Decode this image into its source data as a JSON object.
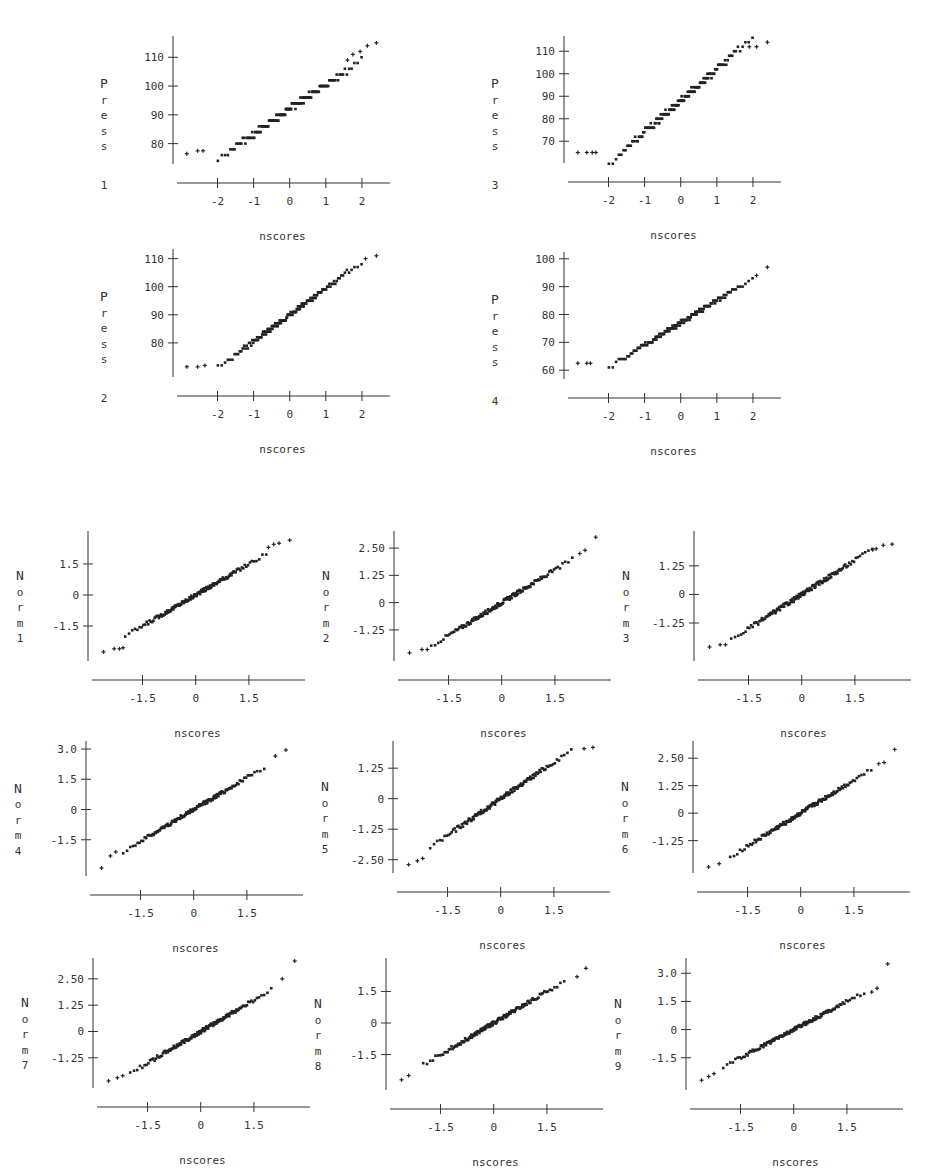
{
  "chart_data": [
    {
      "id": "press1",
      "type": "scatter",
      "title": "",
      "xlabel": "nscores",
      "ylabel": "Press 1",
      "ylabel_chars": [
        "P",
        "r",
        "e",
        "s",
        "s",
        "",
        "1"
      ],
      "xlim": [
        -2.9,
        2.5
      ],
      "ylim": [
        75,
        116
      ],
      "xticks": [
        -2,
        -1,
        0,
        1,
        2
      ],
      "xtick_labels": [
        "-2",
        "-1",
        "0",
        "1",
        "2"
      ],
      "yticks": [
        80,
        90,
        100,
        110
      ],
      "ytick_labels": [
        "80",
        "90",
        "100",
        "110"
      ],
      "n_points": 150,
      "mean": 92,
      "sd": 8.6,
      "step": 2,
      "outliers": [
        [
          -2.85,
          76.5
        ],
        [
          -2.55,
          77.5
        ],
        [
          -2.4,
          77.5
        ],
        [
          1.95,
          112
        ],
        [
          2.4,
          115
        ],
        [
          2.15,
          114
        ],
        [
          1.75,
          111
        ],
        [
          1.6,
          109
        ]
      ],
      "grid": false
    },
    {
      "id": "press3",
      "type": "scatter",
      "title": "",
      "xlabel": "nscores",
      "ylabel": "Press 3",
      "ylabel_chars": [
        "P",
        "r",
        "e",
        "s",
        "s",
        "",
        "3"
      ],
      "xlim": [
        -2.9,
        2.5
      ],
      "ylim": [
        63,
        115
      ],
      "xticks": [
        -2,
        -1,
        0,
        1,
        2
      ],
      "xtick_labels": [
        "-2",
        "-1",
        "0",
        "1",
        "2"
      ],
      "yticks": [
        70,
        80,
        90,
        100,
        110
      ],
      "ytick_labels": [
        "70",
        "80",
        "90",
        "100",
        "110"
      ],
      "n_points": 150,
      "mean": 88,
      "sd": 14,
      "step": 2,
      "outliers": [
        [
          -2.85,
          65
        ],
        [
          -2.6,
          65
        ],
        [
          -2.45,
          65
        ],
        [
          -2.35,
          65
        ],
        [
          1.9,
          112
        ],
        [
          2.1,
          112
        ],
        [
          2.4,
          114
        ]
      ],
      "grid": false
    },
    {
      "id": "press2",
      "type": "scatter",
      "title": "",
      "xlabel": "nscores",
      "ylabel": "Press 2",
      "ylabel_chars": [
        "P",
        "r",
        "e",
        "s",
        "s",
        "",
        "2"
      ],
      "xlim": [
        -2.9,
        2.5
      ],
      "ylim": [
        70,
        112
      ],
      "xticks": [
        -2,
        -1,
        0,
        1,
        2
      ],
      "xtick_labels": [
        "-2",
        "-1",
        "0",
        "1",
        "2"
      ],
      "yticks": [
        80,
        90,
        100,
        110
      ],
      "ytick_labels": [
        "80",
        "90",
        "100",
        "110"
      ],
      "n_points": 150,
      "mean": 90,
      "sd": 9.5,
      "step": 1,
      "outliers": [
        [
          -2.85,
          71.5
        ],
        [
          -2.55,
          71.5
        ],
        [
          -2.35,
          72
        ],
        [
          2.1,
          110
        ],
        [
          2.4,
          111
        ]
      ],
      "grid": false
    },
    {
      "id": "press4",
      "type": "scatter",
      "title": "",
      "xlabel": "nscores",
      "ylabel": "Press 4",
      "ylabel_chars": [
        "P",
        "r",
        "e",
        "s",
        "s",
        "",
        "4"
      ],
      "xlim": [
        -2.9,
        2.5
      ],
      "ylim": [
        59,
        101
      ],
      "xticks": [
        -2,
        -1,
        0,
        1,
        2
      ],
      "xtick_labels": [
        "-2",
        "-1",
        "0",
        "1",
        "2"
      ],
      "yticks": [
        60,
        70,
        80,
        90,
        100
      ],
      "ytick_labels": [
        "60",
        "70",
        "80",
        "90",
        "100"
      ],
      "n_points": 150,
      "mean": 77,
      "sd": 8.0,
      "step": 1,
      "outliers": [
        [
          -2.85,
          62.5
        ],
        [
          -2.6,
          62.5
        ],
        [
          -2.5,
          62.5
        ],
        [
          2.1,
          94
        ],
        [
          2.4,
          97
        ]
      ],
      "grid": false
    },
    {
      "id": "norm1",
      "type": "scatter",
      "xlabel": "nscores",
      "ylabel": "Norm 1",
      "ylabel_chars": [
        "N",
        "o",
        "r",
        "m",
        "1"
      ],
      "xlim": [
        -2.7,
        2.8
      ],
      "ylim": [
        -2.9,
        2.9
      ],
      "xticks": [
        -1.5,
        0,
        1.5
      ],
      "xtick_labels": [
        "-1.5",
        "0",
        "1.5"
      ],
      "yticks": [
        -1.5,
        0,
        1.5
      ],
      "ytick_labels": [
        "-1.5",
        "0",
        "1.5"
      ],
      "n_points": 150,
      "slope": 1.0,
      "outliers": [
        [
          -2.6,
          -2.75
        ],
        [
          -2.3,
          -2.6
        ],
        [
          -2.15,
          -2.6
        ],
        [
          -2.05,
          -2.55
        ],
        [
          2.05,
          2.3
        ],
        [
          2.2,
          2.45
        ],
        [
          2.35,
          2.5
        ],
        [
          2.65,
          2.65
        ]
      ]
    },
    {
      "id": "norm2",
      "type": "scatter",
      "xlabel": "nscores",
      "ylabel": "Norm 2",
      "ylabel_chars": [
        "N",
        "o",
        "r",
        "m",
        "2"
      ],
      "xlim": [
        -2.7,
        2.8
      ],
      "ylim": [
        -2.4,
        3.1
      ],
      "xticks": [
        -1.5,
        0,
        1.5
      ],
      "xtick_labels": [
        "-1.5",
        "0",
        "1.5"
      ],
      "yticks": [
        -1.25,
        0,
        1.25,
        2.5
      ],
      "ytick_labels": [
        "-1.25",
        "0",
        "1.25",
        "2.50"
      ],
      "n_points": 150,
      "slope": 1.0,
      "outliers": [
        [
          -2.6,
          -2.3
        ],
        [
          -2.25,
          -2.15
        ],
        [
          -2.1,
          -2.15
        ],
        [
          2.2,
          2.25
        ],
        [
          2.35,
          2.4
        ],
        [
          2.65,
          3.0
        ]
      ]
    },
    {
      "id": "norm3",
      "type": "scatter",
      "xlabel": "nscores",
      "ylabel": "Norm 3",
      "ylabel_chars": [
        "N",
        "o",
        "r",
        "m",
        "3"
      ],
      "xlim": [
        -2.7,
        2.8
      ],
      "ylim": [
        -2.65,
        2.6
      ],
      "xticks": [
        -1.5,
        0,
        1.5
      ],
      "xtick_labels": [
        "-1.5",
        "0",
        "1.5"
      ],
      "yticks": [
        -1.25,
        0,
        1.25
      ],
      "ytick_labels": [
        "-1.25",
        "0",
        "1.25"
      ],
      "n_points": 150,
      "slope": 1.0,
      "outliers": [
        [
          -2.6,
          -2.3
        ],
        [
          -2.3,
          -2.2
        ],
        [
          -2.15,
          -2.2
        ],
        [
          2.0,
          1.95
        ],
        [
          2.1,
          2.0
        ],
        [
          2.3,
          2.15
        ],
        [
          2.55,
          2.2
        ]
      ]
    },
    {
      "id": "norm4",
      "type": "scatter",
      "xlabel": "nscores",
      "ylabel": "Norm 4",
      "ylabel_chars": [
        "N",
        "o",
        "r",
        "m",
        "4"
      ],
      "xlim": [
        -2.7,
        2.8
      ],
      "ylim": [
        -3.0,
        3.2
      ],
      "xticks": [
        -1.5,
        0,
        1.5
      ],
      "xtick_labels": [
        "-1.5",
        "0",
        "1.5"
      ],
      "yticks": [
        -1.5,
        0,
        1.5,
        3.0
      ],
      "ytick_labels": [
        "-1.5",
        "0",
        "1.5",
        "3.0"
      ],
      "n_points": 150,
      "slope": 1.05,
      "outliers": [
        [
          -2.6,
          -2.9
        ],
        [
          -2.35,
          -2.3
        ],
        [
          -2.2,
          -2.1
        ],
        [
          2.3,
          2.65
        ],
        [
          2.6,
          2.95
        ]
      ]
    },
    {
      "id": "norm5",
      "type": "scatter",
      "xlabel": "nscores",
      "ylabel": "Norm 5",
      "ylabel_chars": [
        "N",
        "o",
        "r",
        "m",
        "5"
      ],
      "xlim": [
        -2.7,
        2.8
      ],
      "ylim": [
        -2.8,
        2.2
      ],
      "xticks": [
        -1.5,
        0,
        1.5
      ],
      "xtick_labels": [
        "-1.5",
        "0",
        "1.5"
      ],
      "yticks": [
        -2.5,
        -1.25,
        0,
        1.25
      ],
      "ytick_labels": [
        "-2.50",
        "-1.25",
        "0",
        "1.25"
      ],
      "n_points": 150,
      "slope": 1.0,
      "outliers": [
        [
          -2.6,
          -2.7
        ],
        [
          -2.35,
          -2.55
        ],
        [
          -2.2,
          -2.45
        ],
        [
          2.35,
          2.05
        ],
        [
          2.6,
          2.1
        ]
      ]
    },
    {
      "id": "norm6",
      "type": "scatter",
      "xlabel": "nscores",
      "ylabel": "Norm 6",
      "ylabel_chars": [
        "N",
        "o",
        "r",
        "m",
        "6"
      ],
      "xlim": [
        -2.7,
        2.8
      ],
      "ylim": [
        -2.45,
        3.1
      ],
      "xticks": [
        -1.5,
        0,
        1.5
      ],
      "xtick_labels": [
        "-1.5",
        "0",
        "1.5"
      ],
      "yticks": [
        -1.25,
        0,
        1.25,
        2.5
      ],
      "ytick_labels": [
        "-1.25",
        "0",
        "1.25",
        "2.50"
      ],
      "n_points": 150,
      "slope": 1.0,
      "outliers": [
        [
          -2.6,
          -2.45
        ],
        [
          -2.3,
          -2.3
        ],
        [
          2.2,
          2.25
        ],
        [
          2.35,
          2.3
        ],
        [
          2.65,
          2.9
        ]
      ]
    },
    {
      "id": "norm7",
      "type": "scatter",
      "xlabel": "nscores",
      "ylabel": "Norm 7",
      "ylabel_chars": [
        "N",
        "o",
        "r",
        "m",
        "7"
      ],
      "xlim": [
        -2.7,
        2.8
      ],
      "ylim": [
        -2.4,
        3.3
      ],
      "xticks": [
        -1.5,
        0,
        1.5
      ],
      "xtick_labels": [
        "-1.5",
        "0",
        "1.5"
      ],
      "yticks": [
        -1.25,
        0,
        1.25,
        2.5
      ],
      "ytick_labels": [
        "-1.25",
        "0",
        "1.25",
        "2.50"
      ],
      "n_points": 150,
      "slope": 1.0,
      "outliers": [
        [
          -2.6,
          -2.35
        ],
        [
          -2.35,
          -2.2
        ],
        [
          -2.2,
          -2.1
        ],
        [
          2.3,
          2.5
        ],
        [
          2.65,
          3.35
        ]
      ]
    },
    {
      "id": "norm8",
      "type": "scatter",
      "xlabel": "nscores",
      "ylabel": "Norm 8",
      "ylabel_chars": [
        "N",
        "o",
        "r",
        "m",
        "8"
      ],
      "xlim": [
        -2.7,
        2.8
      ],
      "ylim": [
        -2.9,
        2.9
      ],
      "xticks": [
        -1.5,
        0,
        1.5
      ],
      "xtick_labels": [
        "-1.5",
        "0",
        "1.5"
      ],
      "yticks": [
        -1.5,
        0,
        1.5
      ],
      "ytick_labels": [
        "-1.5",
        "0",
        "1.5"
      ],
      "n_points": 150,
      "slope": 1.0,
      "outliers": [
        [
          -2.6,
          -2.7
        ],
        [
          -2.4,
          -2.5
        ],
        [
          2.35,
          2.2
        ],
        [
          2.6,
          2.6
        ]
      ]
    },
    {
      "id": "norm9",
      "type": "scatter",
      "xlabel": "nscores",
      "ylabel": "Norm 9",
      "ylabel_chars": [
        "N",
        "o",
        "r",
        "m",
        "9"
      ],
      "xlim": [
        -2.7,
        2.8
      ],
      "ylim": [
        -2.9,
        3.6
      ],
      "xticks": [
        -1.5,
        0,
        1.5
      ],
      "xtick_labels": [
        "-1.5",
        "0",
        "1.5"
      ],
      "yticks": [
        -1.5,
        0,
        1.5,
        3.0
      ],
      "ytick_labels": [
        "-1.5",
        "0",
        "1.5",
        "3.0"
      ],
      "n_points": 150,
      "slope": 1.0,
      "outliers": [
        [
          -2.6,
          -2.7
        ],
        [
          -2.4,
          -2.5
        ],
        [
          -2.25,
          -2.35
        ],
        [
          2.2,
          2.0
        ],
        [
          2.35,
          2.2
        ],
        [
          2.65,
          3.5
        ]
      ]
    }
  ],
  "layout": {
    "press": [
      {
        "ref": 0,
        "left": 175,
        "top": 40,
        "w": 205,
        "h": 118
      },
      {
        "ref": 1,
        "left": 566,
        "top": 40,
        "w": 205,
        "h": 117
      },
      {
        "ref": 2,
        "left": 175,
        "top": 253,
        "w": 205,
        "h": 118
      },
      {
        "ref": 3,
        "left": 566,
        "top": 256,
        "w": 205,
        "h": 117
      }
    ],
    "norm": [
      {
        "ref": 4,
        "left": 90,
        "top": 535,
        "w": 205,
        "h": 120
      },
      {
        "ref": 5,
        "left": 396,
        "top": 535,
        "w": 205,
        "h": 120
      },
      {
        "ref": 6,
        "left": 696,
        "top": 535,
        "w": 205,
        "h": 120
      },
      {
        "ref": 7,
        "left": 88,
        "top": 745,
        "w": 205,
        "h": 125
      },
      {
        "ref": 8,
        "left": 395,
        "top": 745,
        "w": 205,
        "h": 122
      },
      {
        "ref": 9,
        "left": 695,
        "top": 745,
        "w": 205,
        "h": 122
      },
      {
        "ref": 10,
        "left": 95,
        "top": 962,
        "w": 205,
        "h": 120
      },
      {
        "ref": 11,
        "left": 388,
        "top": 962,
        "w": 205,
        "h": 122
      },
      {
        "ref": 12,
        "left": 688,
        "top": 962,
        "w": 205,
        "h": 122
      }
    ]
  }
}
